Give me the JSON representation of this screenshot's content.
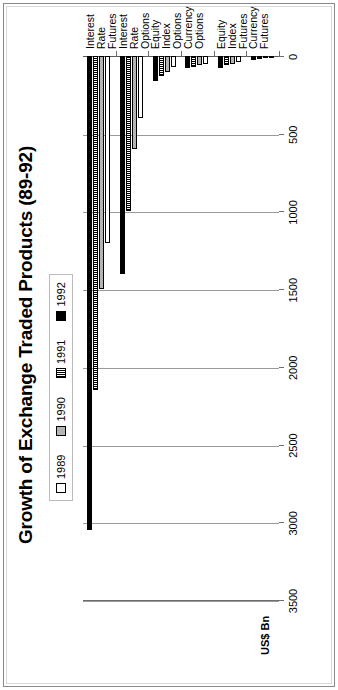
{
  "chart_data": {
    "type": "bar",
    "orientation": "horizontal",
    "title": "Growth of Exchange Traded Products (89-92)",
    "xlabel": "",
    "ylabel": "US$ Bn",
    "axis_unit_label": "US$ Bn",
    "categories": [
      "Interest Rate Futures",
      "Interest Rate Options",
      "Equity Index Options",
      "Currency Options",
      "Equity Index Futures",
      "Currency Futures"
    ],
    "category_lines": [
      [
        "Interest",
        "Rate",
        "Futures"
      ],
      [
        "Interest",
        "Rate",
        "Options"
      ],
      [
        "Equity",
        "Index",
        "Options"
      ],
      [
        "Currency",
        "Options"
      ],
      [
        "Equity",
        "Index",
        "Futures"
      ],
      [
        "Currency",
        "Futures"
      ]
    ],
    "series": [
      {
        "name": "1989",
        "fill": "hollow",
        "color": "#ffffff",
        "values": [
          1200,
          400,
          70,
          50,
          40,
          15
        ]
      },
      {
        "name": "1990",
        "fill": "solid-gray",
        "color": "#b4b4b4",
        "values": [
          1500,
          600,
          100,
          60,
          50,
          15
        ]
      },
      {
        "name": "1991",
        "fill": "vertical-stripes",
        "color": "#000000",
        "values": [
          2150,
          1000,
          130,
          70,
          60,
          20
        ]
      },
      {
        "name": "1992",
        "fill": "solid-black",
        "color": "#000000",
        "values": [
          3050,
          1400,
          160,
          80,
          75,
          25
        ]
      }
    ],
    "legend": [
      "1989",
      "1990",
      "1991",
      "1992"
    ],
    "legend_position": "top-center",
    "xlim": [
      0,
      3500
    ],
    "xticks": [
      0,
      500,
      1000,
      1500,
      2000,
      2500,
      3000,
      3500
    ],
    "xtick_labels": [
      "0",
      "500",
      "1000",
      "1500",
      "2000",
      "2500",
      "3000",
      "3500"
    ],
    "axis_direction": "value axis increases to the left (0 at right)",
    "grid": "vertical gridlines at every tick"
  }
}
